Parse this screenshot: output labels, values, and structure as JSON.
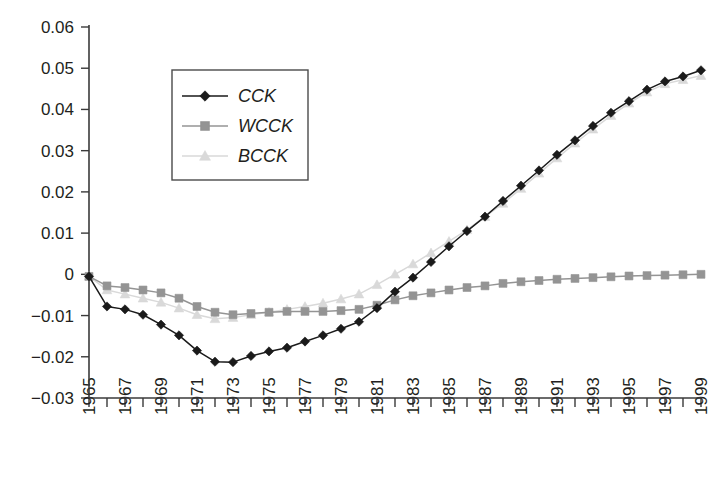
{
  "figure": {
    "background_color": "#ffffff",
    "axis_color": "#3a3a3a",
    "text_color": "#231f20"
  },
  "legend": {
    "position": "upper-left-inside",
    "border_color": "#4a4a4a",
    "entries": [
      {
        "label": "CCK",
        "color": "#1a1a1a",
        "marker": "diamond"
      },
      {
        "label": "WCCK",
        "color": "#949494",
        "marker": "square"
      },
      {
        "label": "BCCK",
        "color": "#d9d9d9",
        "marker": "triangle"
      }
    ]
  },
  "chart_data": {
    "type": "line",
    "title": "",
    "subtitle": "",
    "xlabel": "",
    "ylabel": "",
    "grid": false,
    "legend_position": "upper-left-inside",
    "xlim": [
      1965,
      1999
    ],
    "ylim": [
      -0.03,
      0.06
    ],
    "ytick_labels": [
      "0.06",
      "0.05",
      "0.04",
      "0.03",
      "0.02",
      "0.01",
      "0",
      "−0.01",
      "−0.02",
      "−0.03"
    ],
    "ytick_values": [
      0.06,
      0.05,
      0.04,
      0.03,
      0.02,
      0.01,
      0,
      -0.01,
      -0.02,
      -0.03
    ],
    "x": [
      1965,
      1966,
      1967,
      1968,
      1969,
      1970,
      1971,
      1972,
      1973,
      1974,
      1975,
      1976,
      1977,
      1978,
      1979,
      1980,
      1981,
      1982,
      1983,
      1984,
      1985,
      1986,
      1987,
      1988,
      1989,
      1990,
      1991,
      1992,
      1993,
      1994,
      1995,
      1996,
      1997,
      1998,
      1999
    ],
    "xtick_labels": [
      "1965",
      "",
      "1967",
      "",
      "1969",
      "",
      "1971",
      "",
      "1973",
      "",
      "1975",
      "",
      "1977",
      "",
      "1979",
      "",
      "1981",
      "",
      "1983",
      "",
      "1985",
      "",
      "1987",
      "",
      "1989",
      "",
      "1991",
      "",
      "1993",
      "",
      "1995",
      "",
      "1997",
      "",
      "1999"
    ],
    "xtick_labels_rotation": -90,
    "series": [
      {
        "name": "CCK",
        "color": "#1a1a1a",
        "marker": "diamond",
        "values": [
          -0.0005,
          -0.0078,
          -0.0085,
          -0.0098,
          -0.0122,
          -0.0148,
          -0.0185,
          -0.0212,
          -0.0213,
          -0.0198,
          -0.0187,
          -0.0178,
          -0.0163,
          -0.0148,
          -0.0132,
          -0.0115,
          -0.0082,
          -0.0042,
          -0.0008,
          0.003,
          0.0068,
          0.0105,
          0.014,
          0.0178,
          0.0215,
          0.0252,
          0.029,
          0.0325,
          0.036,
          0.0392,
          0.042,
          0.0448,
          0.0468,
          0.048,
          0.0495
        ]
      },
      {
        "name": "WCCK",
        "color": "#949494",
        "marker": "square",
        "values": [
          -0.0005,
          -0.0028,
          -0.0032,
          -0.0038,
          -0.0045,
          -0.0058,
          -0.0078,
          -0.0092,
          -0.0098,
          -0.0095,
          -0.0092,
          -0.009,
          -0.009,
          -0.009,
          -0.0088,
          -0.0085,
          -0.0075,
          -0.0062,
          -0.0052,
          -0.0045,
          -0.0038,
          -0.0032,
          -0.0028,
          -0.0022,
          -0.0018,
          -0.0015,
          -0.0012,
          -0.001,
          -0.0008,
          -0.0006,
          -0.0004,
          -0.0003,
          -0.0002,
          -0.0001,
          0.0
        ]
      },
      {
        "name": "BCCK",
        "color": "#d9d9d9",
        "marker": "triangle",
        "values": [
          -0.0005,
          -0.0038,
          -0.0048,
          -0.0058,
          -0.0068,
          -0.0082,
          -0.0098,
          -0.0108,
          -0.0105,
          -0.0098,
          -0.0092,
          -0.0085,
          -0.0078,
          -0.007,
          -0.006,
          -0.0048,
          -0.0025,
          0.0,
          0.0025,
          0.0052,
          0.008,
          0.0108,
          0.014,
          0.0172,
          0.0208,
          0.0245,
          0.0282,
          0.0318,
          0.0352,
          0.0385,
          0.0415,
          0.0442,
          0.0462,
          0.0472,
          0.0482
        ]
      }
    ]
  }
}
